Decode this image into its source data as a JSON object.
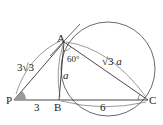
{
  "diagram": {
    "points": {
      "P": "P",
      "A": "A",
      "B": "B",
      "C": "C"
    },
    "labels": {
      "PA": "3√3",
      "PA_coef": "3",
      "PA_rad": "3",
      "PB": "3",
      "BC": "6",
      "AB": "a",
      "AC_rad": "3",
      "AC_var": "a",
      "angle_BAC": "60°"
    },
    "colors": {
      "stroke": "#333333",
      "angle_fill": "#9a9a9a"
    }
  }
}
